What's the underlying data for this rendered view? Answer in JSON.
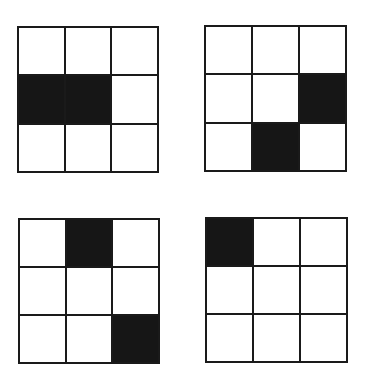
{
  "diagram": {
    "fill_color": "#161616",
    "line_color": "#1a1a1a",
    "background_color": "#ffffff",
    "grids": [
      {
        "id": "grid-top-left",
        "position": "top-left",
        "box": {
          "x": 17,
          "y": 26,
          "w": 142,
          "h": 147
        },
        "cells": [
          [
            0,
            0,
            0
          ],
          [
            1,
            1,
            0
          ],
          [
            0,
            0,
            0
          ]
        ]
      },
      {
        "id": "grid-top-right",
        "position": "top-right",
        "box": {
          "x": 204,
          "y": 25,
          "w": 143,
          "h": 147
        },
        "cells": [
          [
            0,
            0,
            0
          ],
          [
            0,
            0,
            1
          ],
          [
            0,
            1,
            0
          ]
        ]
      },
      {
        "id": "grid-bottom-left",
        "position": "bottom-left",
        "box": {
          "x": 18,
          "y": 218,
          "w": 142,
          "h": 146
        },
        "cells": [
          [
            0,
            1,
            0
          ],
          [
            0,
            0,
            0
          ],
          [
            0,
            0,
            1
          ]
        ]
      },
      {
        "id": "grid-bottom-right",
        "position": "bottom-right",
        "box": {
          "x": 205,
          "y": 217,
          "w": 143,
          "h": 146
        },
        "cells": [
          [
            1,
            0,
            0
          ],
          [
            0,
            0,
            0
          ],
          [
            0,
            0,
            0
          ]
        ]
      }
    ]
  }
}
